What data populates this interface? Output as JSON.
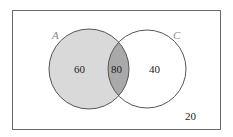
{
  "diagram": {
    "type": "venn",
    "universe_value": "20",
    "sets": [
      {
        "name": "A",
        "only_value": "60"
      },
      {
        "name": "C",
        "only_value": "40"
      }
    ],
    "intersection_value": "80",
    "colors": {
      "border": "#6a6a6a",
      "set_a_fill": "#d9d9d9",
      "intersection_fill": "#a9a9a9",
      "set_c_fill": "#ffffff",
      "circle_stroke": "#555555"
    }
  }
}
